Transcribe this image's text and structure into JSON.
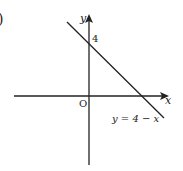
{
  "diagram": {
    "type": "coordinate-plane-line",
    "part_marker": ")",
    "axes": {
      "x_label": "x",
      "y_label": "y",
      "origin_label": "O"
    },
    "intercept_label": "4",
    "line_equation": "y = 4 − x",
    "colors": {
      "ink": "#222222",
      "background": "#ffffff"
    }
  }
}
